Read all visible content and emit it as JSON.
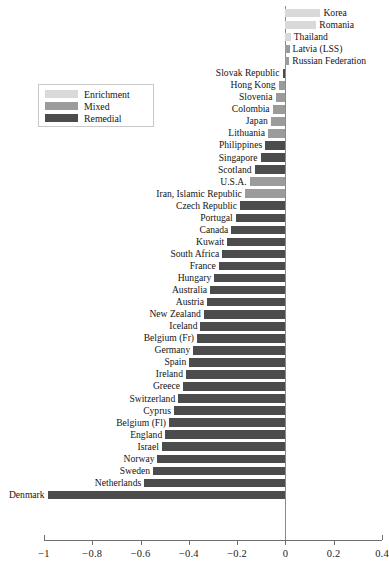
{
  "chart_data": {
    "type": "bar",
    "orientation": "horizontal",
    "title": "",
    "subtitle": "",
    "xlabel": "",
    "ylabel": "",
    "xlim": [
      -1,
      0.4
    ],
    "xticks": [
      -1,
      -0.8,
      -0.6,
      -0.4,
      -0.2,
      0,
      0.2,
      0.4
    ],
    "xticklabels": [
      "−1",
      "−0.8",
      "−0.6",
      "−0.4",
      "−0.2",
      "0",
      "0.2",
      "0.4"
    ],
    "grid": false,
    "legend_position": "upper-left-inside",
    "categories": [
      "Korea",
      "Romania",
      "Thailand",
      "Latvia (LSS)",
      "Russian Federation",
      "Slovak Republic",
      "Hong Kong",
      "Slovenia",
      "Colombia",
      "Japan",
      "Lithuania",
      "Philippines",
      "Singapore",
      "Scotland",
      "U.S.A.",
      "Iran, Islamic Republic",
      "Czech Republic",
      "Portugal",
      "Canada",
      "Kuwait",
      "South Africa",
      "France",
      "Hungary",
      "Australia",
      "Austria",
      "New Zealand",
      "Iceland",
      "Belgium (Fr)",
      "Germany",
      "Spain",
      "Ireland",
      "Greece",
      "Switzerland",
      "Cyprus",
      "Belgium (Fl)",
      "England",
      "Israel",
      "Norway",
      "Sweden",
      "Netherlands",
      "Denmark"
    ],
    "values": [
      0.145,
      0.128,
      0.022,
      0.017,
      0.016,
      -0.012,
      -0.028,
      -0.041,
      -0.053,
      -0.061,
      -0.072,
      -0.084,
      -0.103,
      -0.128,
      -0.148,
      -0.168,
      -0.188,
      -0.206,
      -0.224,
      -0.241,
      -0.262,
      -0.276,
      -0.295,
      -0.312,
      -0.325,
      -0.338,
      -0.352,
      -0.366,
      -0.382,
      -0.398,
      -0.412,
      -0.424,
      -0.444,
      -0.462,
      -0.482,
      -0.498,
      -0.512,
      -0.53,
      -0.548,
      -0.585,
      -0.985
    ],
    "groups": [
      "Enrichment",
      "Enrichment",
      "Enrichment",
      "Mixed",
      "Mixed",
      "Remedial",
      "Mixed",
      "Mixed",
      "Mixed",
      "Mixed",
      "Mixed",
      "Remedial",
      "Remedial",
      "Remedial",
      "Mixed",
      "Mixed",
      "Remedial",
      "Remedial",
      "Remedial",
      "Remedial",
      "Remedial",
      "Remedial",
      "Remedial",
      "Remedial",
      "Remedial",
      "Remedial",
      "Remedial",
      "Remedial",
      "Remedial",
      "Remedial",
      "Remedial",
      "Remedial",
      "Remedial",
      "Remedial",
      "Remedial",
      "Remedial",
      "Remedial",
      "Remedial",
      "Remedial",
      "Remedial",
      "Remedial"
    ],
    "series": [
      {
        "name": "Enrichment",
        "color": "#d9d9d9"
      },
      {
        "name": "Mixed",
        "color": "#9b9b9b"
      },
      {
        "name": "Remedial",
        "color": "#4c4c4c"
      }
    ]
  },
  "legend": {
    "items": [
      {
        "label": "Enrichment",
        "color": "#d9d9d9"
      },
      {
        "label": "Mixed",
        "color": "#9b9b9b"
      },
      {
        "label": "Remedial",
        "color": "#4c4c4c"
      }
    ]
  },
  "colors": {
    "enrichment": "#d9d9d9",
    "mixed": "#9b9b9b",
    "remedial": "#4c4c4c",
    "axis": "#6f6f6f",
    "zero_line": "#8a8a8a",
    "text": "#141414",
    "background": "#ffffff"
  }
}
